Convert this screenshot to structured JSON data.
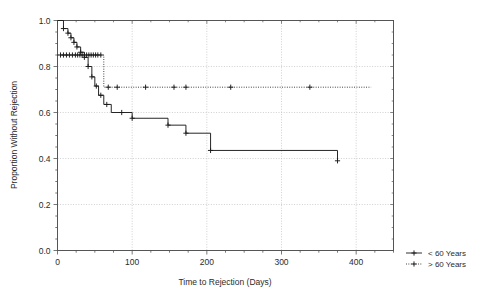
{
  "chart_data": {
    "type": "line",
    "subtype": "kaplan-meier-step",
    "title": "",
    "xlabel": "Time to Rejection (Days)",
    "ylabel": "Proportion Without Rejection",
    "xlim": [
      0,
      450
    ],
    "ylim": [
      0.0,
      1.0
    ],
    "xticks": [
      0,
      100,
      200,
      300,
      400
    ],
    "xticklabels": [
      "0",
      "100",
      "200",
      "300",
      "400"
    ],
    "yticks": [
      0.0,
      0.2,
      0.4,
      0.6,
      0.8,
      1.0
    ],
    "yticklabels": [
      "0.0",
      "0.2",
      "0.4",
      "0.6",
      "0.8",
      "1.0"
    ],
    "grid": true,
    "grid_style": "dotted",
    "legend_position": "outside-bottom-right",
    "series": [
      {
        "name": "< 60 Years",
        "linestyle": "solid",
        "color": "#1a1a1a",
        "points": [
          [
            0,
            1.0
          ],
          [
            8,
            1.0
          ],
          [
            8,
            0.965
          ],
          [
            14,
            0.965
          ],
          [
            14,
            0.945
          ],
          [
            18,
            0.945
          ],
          [
            18,
            0.925
          ],
          [
            22,
            0.925
          ],
          [
            22,
            0.905
          ],
          [
            26,
            0.905
          ],
          [
            26,
            0.885
          ],
          [
            31,
            0.885
          ],
          [
            31,
            0.862
          ],
          [
            36,
            0.862
          ],
          [
            36,
            0.84
          ],
          [
            41,
            0.84
          ],
          [
            41,
            0.8
          ],
          [
            46,
            0.8
          ],
          [
            46,
            0.755
          ],
          [
            50,
            0.755
          ],
          [
            50,
            0.715
          ],
          [
            55,
            0.715
          ],
          [
            55,
            0.675
          ],
          [
            62,
            0.675
          ],
          [
            62,
            0.635
          ],
          [
            72,
            0.635
          ],
          [
            72,
            0.6
          ],
          [
            100,
            0.6
          ],
          [
            100,
            0.575
          ],
          [
            148,
            0.575
          ],
          [
            148,
            0.545
          ],
          [
            172,
            0.545
          ],
          [
            172,
            0.51
          ],
          [
            205,
            0.51
          ],
          [
            205,
            0.435
          ],
          [
            375,
            0.435
          ],
          [
            375,
            0.39
          ]
        ],
        "censor_marks": [
          [
            8,
            0.965
          ],
          [
            14,
            0.945
          ],
          [
            18,
            0.925
          ],
          [
            22,
            0.905
          ],
          [
            26,
            0.885
          ],
          [
            31,
            0.862
          ],
          [
            36,
            0.84
          ],
          [
            41,
            0.8
          ],
          [
            46,
            0.755
          ],
          [
            52,
            0.715
          ],
          [
            58,
            0.675
          ],
          [
            66,
            0.635
          ],
          [
            86,
            0.6
          ],
          [
            100,
            0.575
          ],
          [
            148,
            0.545
          ],
          [
            172,
            0.51
          ],
          [
            205,
            0.435
          ],
          [
            375,
            0.39
          ]
        ]
      },
      {
        "name": "> 60 Years",
        "linestyle": "dotted",
        "color": "#1a1a1a",
        "points": [
          [
            0,
            0.85
          ],
          [
            62,
            0.85
          ],
          [
            62,
            0.71
          ],
          [
            420,
            0.71
          ]
        ],
        "censor_marks": [
          [
            4,
            0.85
          ],
          [
            8,
            0.85
          ],
          [
            12,
            0.85
          ],
          [
            16,
            0.85
          ],
          [
            20,
            0.85
          ],
          [
            24,
            0.85
          ],
          [
            27,
            0.85
          ],
          [
            30,
            0.85
          ],
          [
            33,
            0.85
          ],
          [
            36,
            0.85
          ],
          [
            39,
            0.85
          ],
          [
            42,
            0.85
          ],
          [
            45,
            0.85
          ],
          [
            48,
            0.85
          ],
          [
            51,
            0.85
          ],
          [
            54,
            0.85
          ],
          [
            58,
            0.85
          ],
          [
            68,
            0.71
          ],
          [
            80,
            0.71
          ],
          [
            118,
            0.71
          ],
          [
            156,
            0.71
          ],
          [
            172,
            0.71
          ],
          [
            232,
            0.71
          ],
          [
            338,
            0.71
          ]
        ]
      }
    ]
  },
  "axes": {
    "x_title": "Time to Rejection (Days)",
    "y_title": "Proportion Without Rejection"
  },
  "legend": {
    "entries": [
      {
        "label": "< 60 Years",
        "style": "solid"
      },
      {
        "label": "> 60 Years",
        "style": "dotted"
      }
    ]
  },
  "colors": {
    "line": "#1a1a1a",
    "frame": "#555555",
    "grid": "#bbbbbb",
    "background": "#ffffff"
  }
}
